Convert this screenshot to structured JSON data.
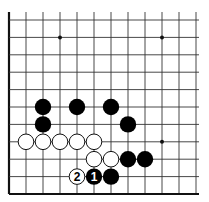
{
  "diagram": {
    "type": "go-board-fragment",
    "grid": {
      "origin_x": 9,
      "origin_y": 20,
      "spacing_x": 17,
      "spacing_y": 17.4,
      "columns": 12,
      "rows": 11,
      "top_open_y": 12,
      "right_open_x": 199,
      "edges": [
        "left",
        "bottom"
      ]
    },
    "colors": {
      "line": "#333333",
      "edge": "#111111",
      "black_stone": "#000000",
      "white_stone": "#ffffff",
      "white_stroke": "#111111"
    },
    "star_points": [
      {
        "col": 3,
        "row": 1
      },
      {
        "col": 9,
        "row": 1
      },
      {
        "col": 9,
        "row": 7
      }
    ],
    "stones": [
      {
        "color": "black",
        "col": 2,
        "row": 5,
        "label": ""
      },
      {
        "color": "black",
        "col": 4,
        "row": 5,
        "label": ""
      },
      {
        "color": "black",
        "col": 6,
        "row": 5,
        "label": ""
      },
      {
        "color": "black",
        "col": 2,
        "row": 6,
        "label": ""
      },
      {
        "color": "black",
        "col": 7,
        "row": 6,
        "label": ""
      },
      {
        "color": "white",
        "col": 1,
        "row": 7,
        "label": ""
      },
      {
        "color": "white",
        "col": 2,
        "row": 7,
        "label": ""
      },
      {
        "color": "white",
        "col": 3,
        "row": 7,
        "label": ""
      },
      {
        "color": "white",
        "col": 4,
        "row": 7,
        "label": ""
      },
      {
        "color": "white",
        "col": 5,
        "row": 7,
        "label": ""
      },
      {
        "color": "white",
        "col": 5,
        "row": 8,
        "label": ""
      },
      {
        "color": "white",
        "col": 6,
        "row": 8,
        "label": ""
      },
      {
        "color": "black",
        "col": 7,
        "row": 8,
        "label": ""
      },
      {
        "color": "black",
        "col": 8,
        "row": 8,
        "label": ""
      },
      {
        "color": "white",
        "col": 4,
        "row": 9,
        "label": "2"
      },
      {
        "color": "black",
        "col": 5,
        "row": 9,
        "label": "1"
      },
      {
        "color": "black",
        "col": 6,
        "row": 9,
        "label": ""
      }
    ],
    "move_labels": [
      "1",
      "2"
    ]
  }
}
